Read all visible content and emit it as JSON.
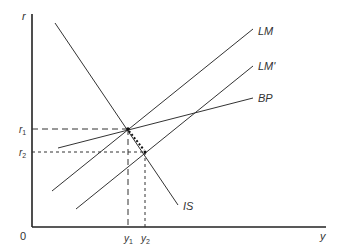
{
  "diagram": {
    "axes": {
      "y_label": "r",
      "x_label": "y",
      "origin_label": "0"
    },
    "curves": [
      {
        "id": "LM",
        "label": "LM"
      },
      {
        "id": "LM_prime",
        "label": "LM'"
      },
      {
        "id": "BP",
        "label": "BP"
      },
      {
        "id": "IS",
        "label": "IS"
      }
    ],
    "levels": {
      "r1": {
        "base": "r",
        "sub": "1"
      },
      "r2": {
        "base": "r",
        "sub": "2"
      },
      "y1": {
        "base": "y",
        "sub": "1"
      },
      "y2": {
        "base": "y",
        "sub": "2"
      }
    }
  }
}
